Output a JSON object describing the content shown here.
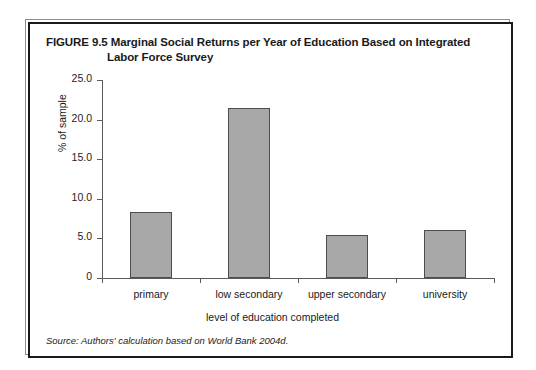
{
  "figure": {
    "title_line1": "FIGURE 9.5  Marginal Social Returns per Year of Education Based on Integrated",
    "title_line2": "Labor Force Survey",
    "source_note": "Source: Authors' calculation based on World Bank 2004d."
  },
  "chart_data": {
    "type": "bar",
    "title": "FIGURE 9.5  Marginal Social Returns per Year of Education Based on Integrated Labor Force Survey",
    "categories": [
      "primary",
      "low secondary",
      "upper secondary",
      "university"
    ],
    "values": [
      8.3,
      21.5,
      5.4,
      6.0
    ],
    "xlabel": "level of education completed",
    "ylabel": "% of sample",
    "ylim": [
      0,
      25
    ],
    "yticks": [
      "0",
      "5.0",
      "10.0",
      "15.0",
      "20.0",
      "25.0"
    ],
    "ytick_values": [
      0,
      5,
      10,
      15,
      20,
      25
    ],
    "grid": false,
    "legend": false,
    "bar_color": "#a8a8a8",
    "bar_border_color": "#4d4d4d"
  }
}
